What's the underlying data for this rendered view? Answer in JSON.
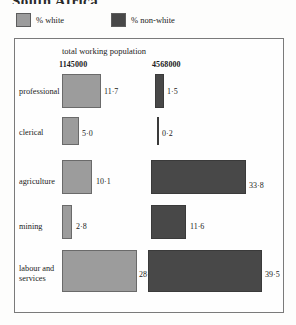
{
  "title": "South Africa",
  "legend": {
    "items": [
      {
        "label": "% white",
        "color": "#9c9c9c",
        "icon": "square-swatch-light"
      },
      {
        "label": "% non-white",
        "color": "#484848",
        "icon": "square-swatch-dark"
      }
    ]
  },
  "chart_header": {
    "caption": "total working population",
    "white_total": "1145000",
    "nonwhite_total": "4568000"
  },
  "chart_data": {
    "type": "bar",
    "orientation": "horizontal",
    "title": "South Africa",
    "subtitle": "total working population",
    "xlabel": "",
    "ylabel": "",
    "categories": [
      "professional",
      "clerical",
      "agriculture",
      "mining",
      "labour and\nservices"
    ],
    "series": [
      {
        "name": "% white",
        "total_population": "1145000",
        "color": "#9c9c9c",
        "values": [
          11.7,
          5.0,
          10.1,
          2.8,
          28.9
        ],
        "labels": [
          "11·7",
          "5·0",
          "10·1",
          "2·8",
          "28·9"
        ]
      },
      {
        "name": "% non-white",
        "total_population": "4568000",
        "color": "#484848",
        "values": [
          1.5,
          0.2,
          33.8,
          11.6,
          39.5
        ],
        "labels": [
          "1·5",
          "0·2",
          "33·8",
          "11·6",
          "39·5"
        ]
      }
    ],
    "grid": false,
    "legend_position": "above-plot",
    "note": "bar width and height both scale with the percentage (area-proportional blocks)"
  },
  "rows": [
    {
      "label": "professional",
      "label_top": 87,
      "white": {
        "label": "11·7",
        "x": 62,
        "y": 74,
        "w": 39,
        "h": 34,
        "val_x": 104,
        "val_y": 87
      },
      "nonwhite": {
        "label": "1·5",
        "x": 155,
        "y": 74,
        "w": 9,
        "h": 34,
        "val_x": 167,
        "val_y": 87
      }
    },
    {
      "label": "clerical",
      "label_top": 128,
      "white": {
        "label": "5·0",
        "x": 62,
        "y": 117,
        "w": 17,
        "h": 28,
        "val_x": 82,
        "val_y": 129
      },
      "nonwhite": {
        "label": "0·2",
        "x": 157,
        "y": 117,
        "w": 2,
        "h": 28,
        "val_x": 162,
        "val_y": 129
      }
    },
    {
      "label": "agriculture",
      "label_top": 177,
      "white": {
        "label": "10·1",
        "x": 62,
        "y": 160,
        "w": 30,
        "h": 34,
        "val_x": 96,
        "val_y": 177
      },
      "nonwhite": {
        "label": "33·8",
        "x": 151,
        "y": 160,
        "w": 95,
        "h": 34,
        "val_x": 249,
        "val_y": 181
      }
    },
    {
      "label": "mining",
      "label_top": 222,
      "white": {
        "label": "2·8",
        "x": 62,
        "y": 205,
        "w": 10,
        "h": 34,
        "val_x": 76,
        "val_y": 222
      },
      "nonwhite": {
        "label": "11·6",
        "x": 151,
        "y": 205,
        "w": 35,
        "h": 34,
        "val_x": 190,
        "val_y": 222
      }
    },
    {
      "label": "labour and\nservices",
      "label_top": 264,
      "white": {
        "label": "28·9",
        "x": 62,
        "y": 250,
        "w": 75,
        "h": 42,
        "val_x": 139,
        "val_y": 270
      },
      "nonwhite": {
        "label": "39·5",
        "x": 148,
        "y": 250,
        "w": 114,
        "h": 42,
        "val_x": 265,
        "val_y": 270
      }
    }
  ]
}
